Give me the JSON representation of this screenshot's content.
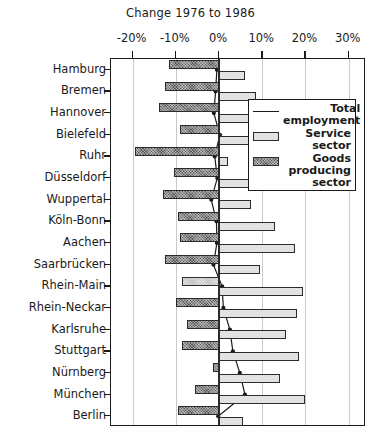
{
  "chart_data": {
    "type": "bar",
    "title": "Change 1976 to 1986",
    "xlabel": "",
    "ylabel": "",
    "orientation": "horizontal",
    "xlim": [
      -25,
      34
    ],
    "xticks": [
      -20,
      -10,
      0,
      10,
      20,
      30
    ],
    "xticklabels": [
      "-20%",
      "-10%",
      "0%",
      "10%",
      "20%",
      "30%"
    ],
    "grid": true,
    "legend_position": "upper right",
    "categories": [
      "Hamburg",
      "Bremen",
      "Hannover",
      "Bielefeld",
      "Ruhr",
      "Düsseldorf",
      "Wuppertal",
      "Köln-Bonn",
      "Aachen",
      "Saarbrücken",
      "Rhein-Main",
      "Rhein-Neckar",
      "Karlsruhe",
      "Stuttgart",
      "Nürnberg",
      "München",
      "Berlin"
    ],
    "series": [
      {
        "name": "Goods producing sector",
        "type": "bar",
        "color": "#585858",
        "pattern": "cross-hatch",
        "values": [
          -11.5,
          -12.5,
          -14.0,
          -9.0,
          -19.5,
          -10.5,
          -13.0,
          -9.5,
          -9.0,
          -12.5,
          -8.5,
          -10.0,
          -7.5,
          -8.5,
          -1.5,
          -5.5,
          -9.5
        ]
      },
      {
        "name": "Service sector",
        "type": "bar",
        "color": "#e2e2e2",
        "values": [
          6.0,
          8.5,
          11.5,
          16.5,
          2.0,
          13.5,
          7.5,
          13.0,
          17.5,
          9.5,
          19.5,
          18.0,
          15.5,
          18.5,
          14.0,
          20.0,
          5.5
        ]
      },
      {
        "name": "Total employment",
        "type": "line",
        "color": "#1a1a1a",
        "marker": "dot",
        "values": [
          -0.5,
          -0.8,
          -1.2,
          0.2,
          -1.0,
          -0.4,
          -1.8,
          -0.6,
          -0.5,
          -1.3,
          0.7,
          1.0,
          2.5,
          3.2,
          4.8,
          6.0,
          -0.2
        ]
      }
    ]
  },
  "legend": {
    "items": [
      {
        "label": "Total employment",
        "swatch": "line"
      },
      {
        "label": "Service sector",
        "swatch": "box-service"
      },
      {
        "label": "Goods producing sector",
        "swatch": "box-goods"
      }
    ]
  }
}
